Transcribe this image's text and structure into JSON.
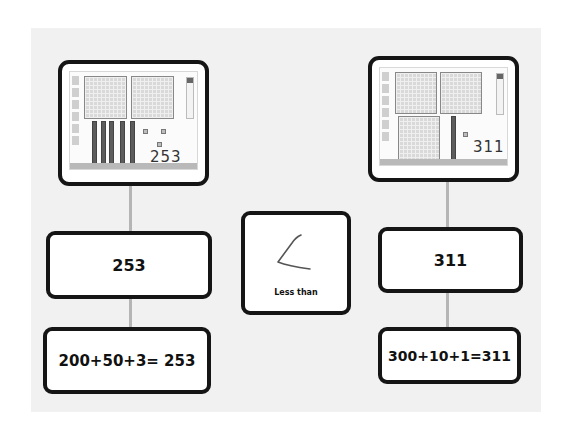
{
  "diagram": {
    "left_column": {
      "tablet_handwriting": "253",
      "number_card": "253",
      "expanded_card": "200+50+3= 253",
      "base_ten_blocks": {
        "hundreds": 2,
        "tens": 5,
        "ones": 3
      }
    },
    "middle": {
      "comparison_label": "Less than",
      "symbol_drawing": "<"
    },
    "right_column": {
      "tablet_handwriting": "311",
      "number_card": "311",
      "expanded_card": "300+10+1=311",
      "base_ten_blocks": {
        "hundreds": 3,
        "tens": 1,
        "ones": 1
      }
    },
    "colors": {
      "border": "#151515",
      "connector": "#b5b5b5",
      "background": "#f1f1f1"
    }
  }
}
